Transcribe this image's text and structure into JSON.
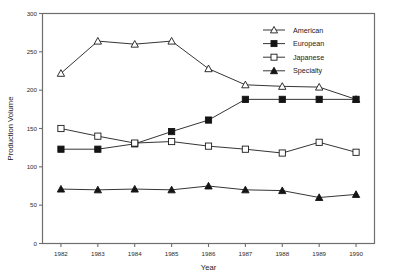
{
  "chart_data": {
    "type": "line",
    "title": "",
    "xlabel": "Year",
    "ylabel": "Production Volume",
    "categories": [
      "1982",
      "1983",
      "1984",
      "1985",
      "1986",
      "1987",
      "1988",
      "1989",
      "1990"
    ],
    "x": [
      1982,
      1983,
      1984,
      1985,
      1986,
      1987,
      1988,
      1989,
      1990
    ],
    "xlim": [
      1981.5,
      1990.5
    ],
    "ylim": [
      0,
      300
    ],
    "yticks": [
      0,
      50,
      100,
      150,
      200,
      250,
      300
    ],
    "xticks": [
      "1982",
      "1983",
      "1984",
      "1985",
      "1986",
      "1987",
      "1988",
      "1989",
      "1990"
    ],
    "grid": false,
    "legend_position": "top-right",
    "series": [
      {
        "name": "American",
        "marker": "open-triangle",
        "values": [
          222,
          264,
          260,
          264,
          228,
          207,
          205,
          204,
          188
        ]
      },
      {
        "name": "European",
        "marker": "filled-square",
        "values": [
          123,
          123,
          130,
          146,
          161,
          188,
          188,
          188,
          188
        ]
      },
      {
        "name": "Japanese",
        "marker": "open-square",
        "values": [
          150,
          140,
          131,
          133,
          127,
          123,
          118,
          132,
          119
        ]
      },
      {
        "name": "Specialty",
        "marker": "filled-triangle",
        "values": [
          71,
          70,
          71,
          70,
          75,
          70,
          69,
          60,
          64
        ]
      }
    ]
  },
  "colors": {
    "line": "#2a2a2a",
    "axis": "#6e6e6e",
    "text": "#1a1a1a",
    "background": "#ffffff"
  }
}
